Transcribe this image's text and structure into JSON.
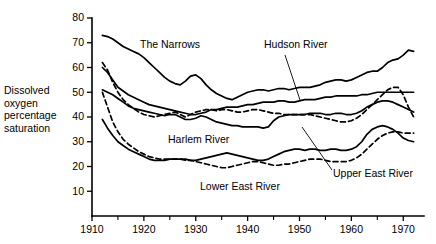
{
  "chart_data": {
    "type": "line",
    "title": "",
    "xlabel": "",
    "ylabel": "Dissolved oxygen percentage saturation",
    "xlim": [
      1910,
      1974
    ],
    "ylim": [
      0,
      80
    ],
    "yticks": [
      10,
      20,
      30,
      40,
      50,
      60,
      70,
      80
    ],
    "xticks": [
      1910,
      1920,
      1930,
      1940,
      1950,
      1960,
      1970
    ],
    "xticks_minor": [
      1915,
      1925,
      1935,
      1945,
      1955,
      1965
    ],
    "grid": false,
    "legend_position": "inline-annotations",
    "series": [
      {
        "name": "The Narrows",
        "style": "solid",
        "x": [
          1912,
          1913,
          1914,
          1915,
          1916,
          1917,
          1918,
          1919,
          1920,
          1921,
          1922,
          1923,
          1924,
          1925,
          1926,
          1927,
          1928,
          1929,
          1930,
          1931,
          1932,
          1933,
          1934,
          1935,
          1936,
          1937,
          1938,
          1939,
          1940,
          1941,
          1942,
          1943,
          1944,
          1945,
          1946,
          1947,
          1948,
          1949,
          1950,
          1951,
          1952,
          1953,
          1954,
          1955,
          1956,
          1957,
          1958,
          1959,
          1960,
          1961,
          1962,
          1963,
          1964,
          1965,
          1966,
          1967,
          1968,
          1969,
          1970,
          1971,
          1972
        ],
        "values": [
          73,
          72.5,
          71.5,
          70,
          68.5,
          67.5,
          66.5,
          65.5,
          64,
          62,
          60,
          58,
          56,
          54.5,
          53.5,
          53,
          54.5,
          56.5,
          57,
          55.5,
          53,
          51,
          49.5,
          48.5,
          47.5,
          47,
          48,
          49,
          50,
          50.5,
          51,
          51,
          50.5,
          51,
          51.5,
          51.5,
          51,
          51.5,
          52,
          52,
          52,
          52.5,
          53,
          54,
          54.5,
          55,
          55,
          54.5,
          55,
          56,
          57,
          58,
          58.5,
          58.5,
          60,
          62,
          63,
          63.5,
          65,
          67,
          66.5
        ]
      },
      {
        "name": "Hudson River",
        "style": "solid",
        "x": [
          1912,
          1913,
          1914,
          1915,
          1916,
          1917,
          1918,
          1919,
          1920,
          1921,
          1922,
          1923,
          1924,
          1925,
          1926,
          1927,
          1928,
          1929,
          1930,
          1931,
          1932,
          1933,
          1934,
          1935,
          1936,
          1937,
          1938,
          1939,
          1940,
          1941,
          1942,
          1943,
          1944,
          1945,
          1946,
          1947,
          1948,
          1949,
          1950,
          1951,
          1952,
          1953,
          1954,
          1955,
          1956,
          1957,
          1958,
          1959,
          1960,
          1961,
          1962,
          1963,
          1964,
          1965,
          1966,
          1967,
          1968,
          1969,
          1970,
          1971,
          1972
        ],
        "values": [
          60,
          58,
          55,
          52,
          50.5,
          49,
          48,
          47,
          46,
          45,
          44.5,
          44,
          43.5,
          43,
          42.5,
          42,
          41.5,
          41,
          41,
          41.5,
          42,
          43,
          43,
          43.5,
          44,
          44,
          44,
          44.5,
          45,
          45,
          45.5,
          46,
          46,
          46,
          46.5,
          46.5,
          46,
          46,
          46.5,
          47,
          47,
          47,
          47.5,
          48,
          48,
          48.5,
          48.5,
          48.5,
          48.5,
          48.5,
          49,
          49,
          49.5,
          50,
          50,
          50,
          50,
          50,
          50,
          50,
          50
        ]
      },
      {
        "name": "Upper East River",
        "style": "dashed",
        "x": [
          1912,
          1913,
          1914,
          1915,
          1916,
          1917,
          1918,
          1919,
          1920,
          1921,
          1922,
          1923,
          1924,
          1925,
          1926,
          1927,
          1928,
          1929,
          1930,
          1931,
          1932,
          1933,
          1934,
          1935,
          1936,
          1937,
          1938,
          1939,
          1940,
          1941,
          1942,
          1943,
          1944,
          1945,
          1946,
          1947,
          1948,
          1949,
          1950,
          1951,
          1952,
          1953,
          1954,
          1955,
          1956,
          1957,
          1958,
          1959,
          1960,
          1961,
          1962,
          1963,
          1964,
          1965,
          1966,
          1967,
          1968,
          1969,
          1970,
          1971,
          1972
        ],
        "values": [
          62,
          59,
          54,
          50,
          47,
          45,
          43.5,
          42,
          41,
          40.5,
          40,
          40.5,
          41,
          41.5,
          42,
          41,
          40,
          41,
          42,
          42.5,
          43,
          43,
          42.5,
          43,
          43,
          42.5,
          42,
          42,
          42.5,
          43,
          43,
          42.5,
          42,
          41.5,
          41.5,
          41,
          41,
          41,
          41,
          41,
          41,
          40.5,
          40,
          39.5,
          39,
          38.5,
          38,
          38,
          38.5,
          39.5,
          41,
          43,
          45,
          47,
          49,
          51,
          52,
          52,
          49,
          44,
          40
        ]
      },
      {
        "name": "Harlem River",
        "style": "solid",
        "x": [
          1912,
          1913,
          1914,
          1915,
          1916,
          1917,
          1918,
          1919,
          1920,
          1921,
          1922,
          1923,
          1924,
          1925,
          1926,
          1927,
          1928,
          1929,
          1930,
          1931,
          1932,
          1933,
          1934,
          1935,
          1936,
          1937,
          1938,
          1939,
          1940,
          1941,
          1942,
          1943,
          1944,
          1945,
          1946,
          1947,
          1948,
          1949,
          1950,
          1951,
          1952,
          1953,
          1954,
          1955,
          1956,
          1957,
          1958,
          1959,
          1960,
          1961,
          1962,
          1963,
          1964,
          1965,
          1966,
          1967,
          1968,
          1969,
          1970,
          1971,
          1972
        ],
        "values": [
          51,
          50,
          49,
          47.5,
          46,
          44.5,
          43.5,
          43,
          42.5,
          42,
          41.5,
          41,
          40.5,
          41,
          41,
          40,
          39,
          39,
          39.5,
          40.5,
          40,
          39,
          38,
          37.5,
          37,
          36.5,
          36.5,
          36,
          36,
          36,
          36,
          35.5,
          36,
          38.5,
          40,
          40.5,
          41,
          41,
          41,
          41,
          41.5,
          41.5,
          41.5,
          41,
          41,
          41.5,
          41.5,
          41,
          41,
          41.5,
          42.5,
          44,
          45,
          46,
          46.5,
          46.5,
          46,
          45,
          44,
          43,
          42
        ]
      },
      {
        "name": "Harlem River lower",
        "style": "solid",
        "x": [
          1912,
          1913,
          1914,
          1915,
          1916,
          1917,
          1918,
          1919,
          1920,
          1921,
          1922,
          1923,
          1924,
          1925,
          1926,
          1927,
          1928,
          1929,
          1930,
          1931,
          1932,
          1933,
          1934,
          1935,
          1936,
          1937,
          1938,
          1939,
          1940,
          1941,
          1942,
          1943,
          1944,
          1945,
          1946,
          1947,
          1948,
          1949,
          1950,
          1951,
          1952,
          1953,
          1954,
          1955,
          1956,
          1957,
          1958,
          1959,
          1960,
          1961,
          1962,
          1963,
          1964,
          1965,
          1966,
          1967,
          1968,
          1969,
          1970,
          1971,
          1972
        ],
        "values": [
          39,
          35.5,
          32.5,
          30,
          28.5,
          27,
          26,
          25,
          24,
          23,
          22.5,
          22.5,
          22.5,
          23,
          23,
          23,
          23,
          22.5,
          22.5,
          23,
          23.5,
          24,
          24.5,
          25,
          25.5,
          25,
          24.5,
          24,
          23.5,
          23,
          22.5,
          22.5,
          23,
          24,
          25,
          26,
          26.5,
          27,
          27,
          26.5,
          27,
          27,
          26.5,
          26.5,
          27,
          27,
          26.5,
          26.5,
          27,
          28,
          30,
          33,
          35,
          36,
          36.5,
          36,
          35,
          33.5,
          31.5,
          30.5,
          30
        ]
      },
      {
        "name": "Lower East River",
        "style": "dashed",
        "x": [
          1912,
          1913,
          1914,
          1915,
          1916,
          1917,
          1918,
          1919,
          1920,
          1921,
          1922,
          1923,
          1924,
          1925,
          1926,
          1927,
          1928,
          1929,
          1930,
          1931,
          1932,
          1933,
          1934,
          1935,
          1936,
          1937,
          1938,
          1939,
          1940,
          1941,
          1942,
          1943,
          1944,
          1945,
          1946,
          1947,
          1948,
          1949,
          1950,
          1951,
          1952,
          1953,
          1954,
          1955,
          1956,
          1957,
          1958,
          1959,
          1960,
          1961,
          1962,
          1963,
          1964,
          1965,
          1966,
          1967,
          1968,
          1969,
          1970,
          1971,
          1972
        ],
        "values": [
          50,
          44,
          38,
          34,
          31,
          29,
          27.5,
          26,
          25,
          24,
          23.5,
          23,
          23,
          23,
          23,
          23,
          22.5,
          22.5,
          22,
          21.5,
          21,
          20.5,
          20,
          19.5,
          19.5,
          20,
          20.5,
          21,
          21.5,
          22,
          22,
          21.5,
          21,
          20.5,
          20.5,
          21,
          21,
          21.5,
          22,
          22.5,
          23,
          23,
          23,
          22.5,
          22,
          22,
          22,
          22,
          22.5,
          23.5,
          25,
          27,
          29,
          31,
          32.5,
          33.5,
          34,
          34,
          33.5,
          33.5,
          33.5
        ]
      }
    ],
    "annotations": [
      {
        "text": "The Narrows",
        "x": 140,
        "y": 48,
        "leader": null
      },
      {
        "text": "Hudson River",
        "x": 264,
        "y": 48,
        "leader": {
          "x1": 285,
          "y1": 55,
          "x2": 300,
          "y2": 100
        }
      },
      {
        "text": "Harlem River",
        "x": 168,
        "y": 143,
        "leader": null
      },
      {
        "text": "Lower East River",
        "x": 200,
        "y": 190,
        "leader": null
      },
      {
        "text": "Upper East River",
        "x": 333,
        "y": 177,
        "leader": {
          "x1": 332,
          "y1": 170,
          "x2": 302,
          "y2": 127
        }
      }
    ]
  },
  "axis": {
    "y_label_lines": [
      "Dissolved",
      "oxygen",
      "percentage",
      "saturation"
    ]
  }
}
